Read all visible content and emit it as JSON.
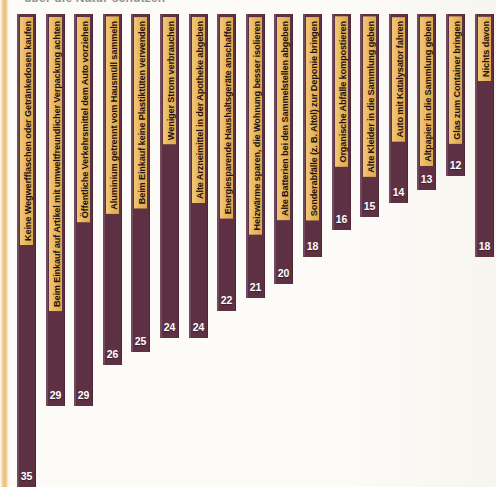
{
  "title_partial": "über die Natur schützen",
  "colors": {
    "bar": "#5d3044",
    "label_box": "#eab961",
    "value_text": "#ffffff",
    "background": "#fcfbf8",
    "page_edge": "#eab974"
  },
  "chart_data": {
    "type": "bar",
    "title": "",
    "xlabel": "",
    "ylabel": "",
    "ylim": [
      0,
      35
    ],
    "grid": false,
    "legend": null,
    "orientation": "vertical-descending",
    "value_suffix": "",
    "categories": [
      "Keine Wegwerfflaschen oder Getränkedosen kaufen",
      "Beim Einkauf auf Artikel mit umweltfreundlicher Verpackung achten",
      "Öffentliche Verkehrsmittel dem Auto vorziehen",
      "Aluminium getrennt vom Hausmüll sammeln",
      "Beim Einkauf keine Plastiktüten verwenden",
      "Weniger Strom verbrauchen",
      "Alte Arzneimittel in der Apotheke abgeben",
      "Energiesparende Haushaltsgeräte anschaffen",
      "Heizwärme sparen, die Wohnung besser isolieren",
      "Alte Batterien bei den Sammelstellen abgeben",
      "Sonderabfälle (z. B. Altöl) zur Deponie bringen",
      "Organische Abfälle kompostieren",
      "Alte Kleider in die Sammlung geben",
      "Auto mit Katalysator fahren",
      "Altpapier in die Sammlung geben",
      "Glas zum Container bringen",
      "Nichts davon"
    ],
    "values": [
      35,
      29,
      29,
      26,
      25,
      24,
      24,
      22,
      21,
      20,
      18,
      16,
      15,
      14,
      13,
      12,
      18
    ]
  }
}
